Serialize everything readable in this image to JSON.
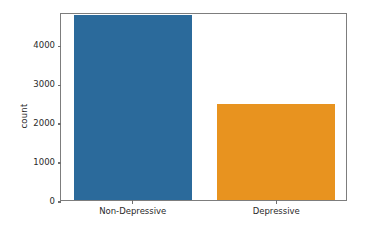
{
  "chart_data": {
    "type": "bar",
    "title": "",
    "xlabel": "",
    "ylabel": "count",
    "categories": [
      "Non-Depressive",
      "Depressive"
    ],
    "values": [
      4750,
      2470
    ],
    "colors": [
      "#2b6a9b",
      "#e8931f"
    ],
    "ylim": [
      0,
      4825
    ],
    "yticks": [
      0,
      1000,
      2000,
      3000,
      4000
    ],
    "ytick_labels": [
      "0",
      "1000",
      "2000",
      "3000",
      "4000"
    ],
    "xtick_labels": [
      "Non-Depressive",
      "Depressive"
    ],
    "grid": false,
    "legend": false,
    "legend_position": "none",
    "frame_color": "#7d7d7d",
    "background": "#ffffff",
    "bars": [
      {
        "label": "Non-Depressive",
        "value": 4750,
        "color": "#2b6a9b"
      },
      {
        "label": "Depressive",
        "value": 2470,
        "color": "#e8931f"
      }
    ]
  }
}
